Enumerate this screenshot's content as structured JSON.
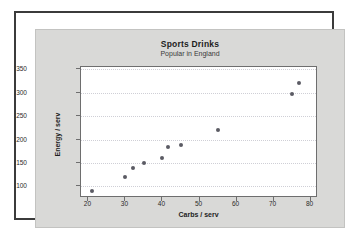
{
  "figure": {
    "background": "#ffffff",
    "panel_color": "#d9d9d7",
    "frame_color": "#3b3b3b",
    "plot_background": "#ffffff"
  },
  "chart_data": {
    "type": "scatter",
    "title": "Sports Drinks",
    "subtitle": "Popular in England",
    "xlabel": "Carbs / serv",
    "ylabel": "Energy / serv",
    "xlim": [
      18,
      82
    ],
    "ylim": [
      75,
      355
    ],
    "xticks": [
      20,
      30,
      40,
      50,
      60,
      70,
      80
    ],
    "yticks": [
      100,
      150,
      200,
      250,
      300,
      350
    ],
    "grid": "horizontal-dotted",
    "legend": null,
    "marker_color": "#5b5b64",
    "marker_size": 4,
    "points": [
      {
        "x": 21,
        "y": 91
      },
      {
        "x": 30,
        "y": 120
      },
      {
        "x": 32,
        "y": 140
      },
      {
        "x": 35,
        "y": 150
      },
      {
        "x": 40,
        "y": 160
      },
      {
        "x": 41.5,
        "y": 183
      },
      {
        "x": 45,
        "y": 189
      },
      {
        "x": 55,
        "y": 221
      },
      {
        "x": 75,
        "y": 298
      },
      {
        "x": 77,
        "y": 321
      }
    ],
    "x": [
      21,
      30,
      32,
      35,
      40,
      41.5,
      45,
      55,
      75,
      77
    ],
    "values": [
      91,
      120,
      140,
      150,
      160,
      183,
      189,
      221,
      298,
      321
    ]
  }
}
